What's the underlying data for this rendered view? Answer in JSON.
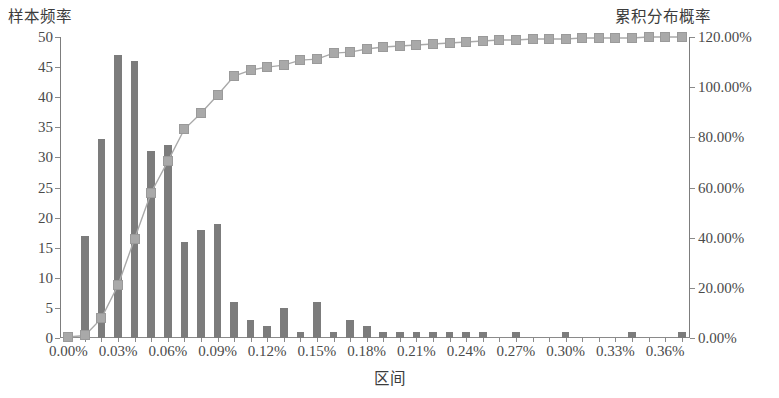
{
  "chart_data": {
    "type": "bar",
    "title": "",
    "xlabel": "区间",
    "ylabel": "样本频率",
    "y2label": "累积分布概率",
    "ylim": [
      0,
      50
    ],
    "y2lim": [
      0,
      120
    ],
    "ytick_labels": [
      "0",
      "5",
      "10",
      "15",
      "20",
      "25",
      "30",
      "35",
      "40",
      "45",
      "50"
    ],
    "ytick_values": [
      0,
      5,
      10,
      15,
      20,
      25,
      30,
      35,
      40,
      45,
      50
    ],
    "y2tick_labels": [
      "0.00%",
      "20.00%",
      "40.00%",
      "60.00%",
      "80.00%",
      "100.00%",
      "120.00%"
    ],
    "y2tick_values": [
      0,
      20,
      40,
      60,
      80,
      100,
      120
    ],
    "xtick_labels": [
      "0.00%",
      "0.03%",
      "0.06%",
      "0.09%",
      "0.12%",
      "0.15%",
      "0.18%",
      "0.21%",
      "0.24%",
      "0.27%",
      "0.30%",
      "0.33%",
      "0.36%"
    ],
    "xtick_values": [
      0,
      0.03,
      0.06,
      0.09,
      0.12,
      0.15,
      0.18,
      0.21,
      0.24,
      0.27,
      0.3,
      0.33,
      0.36
    ],
    "x_step": 0.01,
    "grid": false,
    "legend": "none",
    "bar_color": "#7c7c7c",
    "line_color": "#a9a9a9",
    "marker_color": "#a9a9a9",
    "axis_color": "#8a8a8a",
    "categories": [
      "0.00%",
      "0.01%",
      "0.02%",
      "0.03%",
      "0.04%",
      "0.05%",
      "0.06%",
      "0.07%",
      "0.08%",
      "0.09%",
      "0.10%",
      "0.11%",
      "0.12%",
      "0.13%",
      "0.14%",
      "0.15%",
      "0.16%",
      "0.17%",
      "0.18%",
      "0.19%",
      "0.20%",
      "0.21%",
      "0.22%",
      "0.23%",
      "0.24%",
      "0.25%",
      "0.26%",
      "0.27%",
      "0.28%",
      "0.29%",
      "0.30%",
      "0.31%",
      "0.32%",
      "0.33%",
      "0.34%",
      "0.35%",
      "0.36%",
      "0.37%"
    ],
    "series": [
      {
        "name": "样本频率",
        "axis": "left",
        "type": "bar",
        "values": [
          1,
          17,
          33,
          47,
          46,
          31,
          32,
          16,
          18,
          19,
          6,
          3,
          2,
          5,
          1,
          6,
          1,
          3,
          2,
          1,
          1,
          1,
          1,
          1,
          1,
          1,
          0,
          1,
          0,
          0,
          1,
          0,
          0,
          0,
          1,
          0,
          0,
          1
        ]
      },
      {
        "name": "累积分布概率",
        "axis": "right",
        "type": "line",
        "values": [
          0.4,
          1.0,
          7.8,
          21.0,
          39.6,
          58.0,
          70.4,
          83.2,
          89.6,
          96.8,
          104.4,
          106.8,
          108.0,
          108.8,
          110.8,
          111.2,
          113.6,
          114.0,
          115.2,
          116.0,
          116.4,
          116.8,
          117.2,
          117.6,
          118.0,
          118.4,
          118.8,
          118.8,
          119.2,
          119.2,
          119.2,
          119.6,
          119.6,
          119.6,
          119.6,
          120.0,
          120.0,
          120.0
        ]
      }
    ],
    "cumulative_percent_display": [
      0.4,
      1.0,
      7.8,
      21.0,
      39.6,
      58.0,
      70.4,
      83.2,
      89.6,
      96.8,
      104.4,
      106.8,
      108.0,
      108.8,
      110.8,
      111.2,
      113.6,
      114.0,
      115.2,
      116.0,
      116.4,
      116.8,
      117.2,
      117.6,
      118.0,
      118.4,
      118.8,
      118.8,
      119.2,
      119.2,
      119.2,
      119.6,
      119.6,
      119.6,
      119.6,
      120.0,
      120.0,
      120.0
    ]
  }
}
